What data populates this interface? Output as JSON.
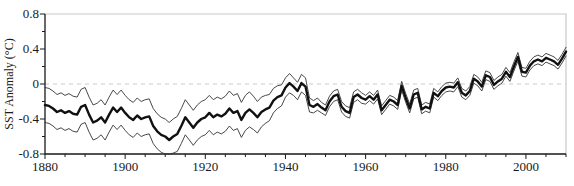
{
  "figure": {
    "background": "#ffffff",
    "ylabel": "SST Anomaly (°C)"
  },
  "chart_data": {
    "type": "line",
    "title": "",
    "xlabel": "",
    "ylabel": "SST Anomaly (°C)",
    "xlim": [
      1880,
      2010
    ],
    "ylim": [
      -0.8,
      0.8
    ],
    "grid": false,
    "legend": "none",
    "x_major_ticks": [
      1880,
      1900,
      1920,
      1940,
      1960,
      1980,
      2000
    ],
    "x_tick_labels": [
      "1880",
      "1900",
      "1920",
      "1940",
      "1960",
      "1980",
      "2000"
    ],
    "x_minor_step": 5,
    "y_major_ticks": [
      0.8,
      0.4,
      0,
      -0.4,
      -0.8
    ],
    "y_tick_labels": [
      "0.8",
      "0.4",
      "0",
      "-0.4",
      "-0.8"
    ],
    "y_minor_step": 0.2,
    "zero_line": {
      "value": 0,
      "style": "dashed",
      "color": "#cccccc"
    },
    "colors": {
      "axis": "#1a1a1a",
      "frame_light": "#c8c8c8",
      "mean_line": "#111111",
      "bound_line": "#333333",
      "zero_line": "#cccccc"
    },
    "years": [
      1880,
      1881,
      1882,
      1883,
      1884,
      1885,
      1886,
      1887,
      1888,
      1889,
      1890,
      1891,
      1892,
      1893,
      1894,
      1895,
      1896,
      1897,
      1898,
      1899,
      1900,
      1901,
      1902,
      1903,
      1904,
      1905,
      1906,
      1907,
      1908,
      1909,
      1910,
      1911,
      1912,
      1913,
      1914,
      1915,
      1916,
      1917,
      1918,
      1919,
      1920,
      1921,
      1922,
      1923,
      1924,
      1925,
      1926,
      1927,
      1928,
      1929,
      1930,
      1931,
      1932,
      1933,
      1934,
      1935,
      1936,
      1937,
      1938,
      1939,
      1940,
      1941,
      1942,
      1943,
      1944,
      1945,
      1946,
      1947,
      1948,
      1949,
      1950,
      1951,
      1952,
      1953,
      1954,
      1955,
      1956,
      1957,
      1958,
      1959,
      1960,
      1961,
      1962,
      1963,
      1964,
      1965,
      1966,
      1967,
      1968,
      1969,
      1970,
      1971,
      1972,
      1973,
      1974,
      1975,
      1976,
      1977,
      1978,
      1979,
      1980,
      1981,
      1982,
      1983,
      1984,
      1985,
      1986,
      1987,
      1988,
      1989,
      1990,
      1991,
      1992,
      1993,
      1994,
      1995,
      1996,
      1997,
      1998,
      1999,
      2000,
      2001,
      2002,
      2003,
      2004,
      2005,
      2006,
      2007,
      2008,
      2009,
      2010
    ],
    "series": [
      {
        "name": "upper-uncertainty-bound",
        "style": "thin",
        "width": 0.9,
        "values": [
          -0.04,
          -0.05,
          -0.08,
          -0.12,
          -0.1,
          -0.13,
          -0.11,
          -0.14,
          -0.15,
          -0.06,
          -0.04,
          -0.15,
          -0.24,
          -0.22,
          -0.18,
          -0.24,
          -0.15,
          -0.07,
          -0.12,
          -0.07,
          -0.13,
          -0.18,
          -0.21,
          -0.16,
          -0.2,
          -0.18,
          -0.17,
          -0.28,
          -0.34,
          -0.38,
          -0.4,
          -0.44,
          -0.4,
          -0.37,
          -0.28,
          -0.18,
          -0.24,
          -0.3,
          -0.24,
          -0.2,
          -0.18,
          -0.13,
          -0.18,
          -0.15,
          -0.17,
          -0.14,
          -0.08,
          -0.13,
          -0.11,
          -0.21,
          -0.13,
          -0.09,
          -0.14,
          -0.2,
          -0.15,
          -0.13,
          -0.12,
          -0.05,
          -0.02,
          -0.01,
          0.07,
          0.12,
          0.07,
          0.02,
          0.11,
          0.07,
          -0.16,
          -0.19,
          -0.16,
          -0.21,
          -0.24,
          -0.14,
          -0.08,
          -0.06,
          -0.2,
          -0.25,
          -0.27,
          -0.09,
          -0.06,
          -0.1,
          -0.13,
          -0.09,
          -0.13,
          -0.07,
          -0.25,
          -0.19,
          -0.13,
          -0.15,
          -0.19,
          0.03,
          -0.11,
          -0.23,
          -0.07,
          -0.05,
          -0.24,
          -0.21,
          -0.23,
          -0.05,
          -0.09,
          -0.03,
          0.01,
          0.02,
          0.01,
          0.07,
          -0.05,
          -0.08,
          -0.03,
          0.11,
          0.08,
          0.02,
          0.15,
          0.13,
          0.04,
          0.08,
          0.11,
          0.19,
          0.13,
          0.25,
          0.36,
          0.19,
          0.18,
          0.26,
          0.31,
          0.33,
          0.31,
          0.35,
          0.33,
          0.31,
          0.27,
          0.34,
          0.42
        ]
      },
      {
        "name": "lower-uncertainty-bound",
        "style": "thin",
        "width": 0.9,
        "values": [
          -0.44,
          -0.45,
          -0.48,
          -0.52,
          -0.5,
          -0.53,
          -0.51,
          -0.54,
          -0.55,
          -0.46,
          -0.44,
          -0.55,
          -0.64,
          -0.62,
          -0.58,
          -0.64,
          -0.55,
          -0.47,
          -0.52,
          -0.47,
          -0.53,
          -0.58,
          -0.61,
          -0.56,
          -0.6,
          -0.58,
          -0.57,
          -0.68,
          -0.74,
          -0.78,
          -0.8,
          -0.8,
          -0.79,
          -0.77,
          -0.68,
          -0.58,
          -0.64,
          -0.7,
          -0.64,
          -0.6,
          -0.58,
          -0.53,
          -0.58,
          -0.55,
          -0.57,
          -0.54,
          -0.48,
          -0.53,
          -0.51,
          -0.61,
          -0.53,
          -0.49,
          -0.52,
          -0.56,
          -0.49,
          -0.45,
          -0.42,
          -0.33,
          -0.28,
          -0.25,
          -0.15,
          -0.1,
          -0.13,
          -0.18,
          -0.09,
          -0.13,
          -0.32,
          -0.33,
          -0.3,
          -0.33,
          -0.36,
          -0.26,
          -0.2,
          -0.18,
          -0.32,
          -0.37,
          -0.39,
          -0.21,
          -0.18,
          -0.22,
          -0.23,
          -0.19,
          -0.23,
          -0.17,
          -0.35,
          -0.29,
          -0.23,
          -0.25,
          -0.29,
          -0.07,
          -0.21,
          -0.33,
          -0.17,
          -0.15,
          -0.34,
          -0.31,
          -0.33,
          -0.15,
          -0.19,
          -0.13,
          -0.09,
          -0.08,
          -0.09,
          -0.03,
          -0.15,
          -0.18,
          -0.13,
          0.01,
          -0.02,
          -0.08,
          0.05,
          0.03,
          -0.06,
          -0.02,
          0.01,
          0.09,
          0.03,
          0.15,
          0.26,
          0.09,
          0.08,
          0.16,
          0.21,
          0.23,
          0.21,
          0.25,
          0.23,
          0.21,
          0.17,
          0.24,
          0.32
        ]
      },
      {
        "name": "annual-mean-sst-anomaly",
        "style": "thick",
        "width": 2.4,
        "values": [
          -0.24,
          -0.25,
          -0.28,
          -0.32,
          -0.3,
          -0.33,
          -0.31,
          -0.34,
          -0.35,
          -0.26,
          -0.24,
          -0.35,
          -0.44,
          -0.42,
          -0.38,
          -0.44,
          -0.35,
          -0.27,
          -0.32,
          -0.27,
          -0.33,
          -0.38,
          -0.41,
          -0.36,
          -0.4,
          -0.38,
          -0.37,
          -0.48,
          -0.54,
          -0.58,
          -0.6,
          -0.64,
          -0.6,
          -0.57,
          -0.48,
          -0.38,
          -0.44,
          -0.5,
          -0.44,
          -0.4,
          -0.38,
          -0.33,
          -0.38,
          -0.35,
          -0.37,
          -0.34,
          -0.28,
          -0.33,
          -0.31,
          -0.41,
          -0.33,
          -0.29,
          -0.33,
          -0.38,
          -0.32,
          -0.29,
          -0.27,
          -0.19,
          -0.15,
          -0.13,
          -0.04,
          0.01,
          -0.03,
          -0.08,
          0.01,
          -0.03,
          -0.24,
          -0.26,
          -0.23,
          -0.27,
          -0.3,
          -0.2,
          -0.14,
          -0.12,
          -0.26,
          -0.31,
          -0.33,
          -0.15,
          -0.12,
          -0.16,
          -0.18,
          -0.14,
          -0.18,
          -0.12,
          -0.3,
          -0.24,
          -0.18,
          -0.2,
          -0.24,
          -0.02,
          -0.16,
          -0.28,
          -0.12,
          -0.1,
          -0.29,
          -0.26,
          -0.28,
          -0.1,
          -0.14,
          -0.08,
          -0.04,
          -0.03,
          -0.04,
          0.02,
          -0.1,
          -0.13,
          -0.08,
          0.06,
          0.03,
          -0.03,
          0.1,
          0.08,
          -0.01,
          0.03,
          0.06,
          0.14,
          0.08,
          0.2,
          0.31,
          0.14,
          0.13,
          0.21,
          0.26,
          0.28,
          0.26,
          0.3,
          0.28,
          0.26,
          0.22,
          0.29,
          0.37
        ]
      }
    ]
  }
}
